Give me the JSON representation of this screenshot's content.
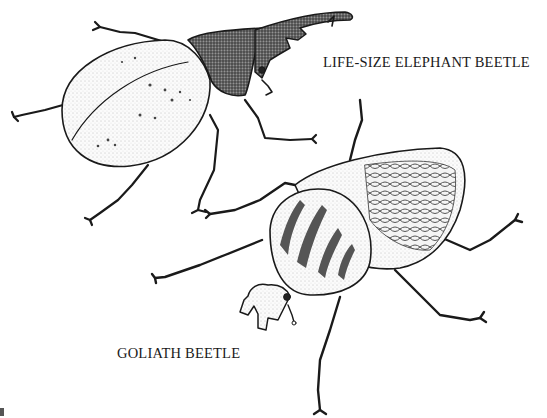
{
  "plate": {
    "type": "pen-and-ink illustration",
    "background": "#ffffff",
    "ink_color": "#1a1a1a"
  },
  "labels": {
    "elephant_beetle": "LIFE-SIZE ELEPHANT BEETLE",
    "goliath_beetle": "GOLIATH BEETLE"
  },
  "figures": [
    {
      "name": "elephant-beetle",
      "position": "top-left",
      "features": [
        "long curved horn",
        "dark stippled pronotum",
        "pale dotted elytra",
        "six segmented legs"
      ]
    },
    {
      "name": "goliath-beetle",
      "position": "bottom-right",
      "features": [
        "Y-shaped head horn",
        "striped pronotum",
        "reticulated pattern on elytra",
        "six spiny legs"
      ]
    }
  ]
}
